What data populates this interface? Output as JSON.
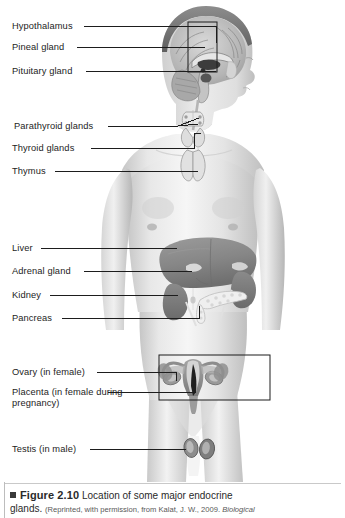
{
  "figure": {
    "number": "Figure 2.10",
    "marker": "square-bullet",
    "title": "Location of some major endocrine",
    "title_line2": "glands.",
    "credit": "(Reprinted, with permission, from Kalat, J. W., 2009. ",
    "credit_italic": "Biological"
  },
  "illustration": {
    "subject": "human male torso anterior view with endocrine glands",
    "colors": {
      "skin_light": "#f2f2f2",
      "skin_mid": "#d8d8d8",
      "skin_shadow": "#b9b9b9",
      "organ_liver": "#8e8e8e",
      "organ_kidney": "#7d7d7d",
      "organ_dark": "#5e5e5e",
      "organ_light": "#c9c9c9",
      "line": "#1d1d1d",
      "background": "#ffffff"
    },
    "callout_boxes": [
      {
        "name": "brain-detail-box",
        "x": 188,
        "y": 22,
        "w": 29,
        "h": 50
      },
      {
        "name": "uterus-detail-box",
        "x": 159,
        "y": 355,
        "w": 111,
        "h": 45
      }
    ]
  },
  "labels": [
    {
      "id": "hypothalamus",
      "text": "Hypothalamus",
      "x": 12,
      "y": 21,
      "line_x1": 84,
      "line_x2": 216,
      "line_y": 26
    },
    {
      "id": "pineal-gland",
      "text": "Pineal gland",
      "x": 12,
      "y": 42,
      "line_x1": 77,
      "line_x2": 212,
      "line_y": 47
    },
    {
      "id": "pituitary-gland",
      "text": "Pituitary gland",
      "x": 12,
      "y": 66,
      "line_x1": 86,
      "line_x2": 216,
      "line_y": 71
    },
    {
      "id": "parathyroid-glands",
      "text": "Parathyroid glands",
      "x": 14,
      "y": 121,
      "line_x1": 108,
      "line_x2": 196,
      "line_y": 126
    },
    {
      "id": "thyroid-glands",
      "text": "Thyroid glands",
      "x": 12,
      "y": 143,
      "line_x1": 91,
      "line_x2": 210,
      "line_y": 148
    },
    {
      "id": "thymus",
      "text": "Thymus",
      "x": 12,
      "y": 166,
      "line_x1": 55,
      "line_x2": 212,
      "line_y": 171
    },
    {
      "id": "liver",
      "text": "Liver",
      "x": 12,
      "y": 243,
      "line_x1": 41,
      "line_x2": 178,
      "line_y": 248
    },
    {
      "id": "adrenal-gland",
      "text": "Adrenal gland",
      "x": 12,
      "y": 266,
      "line_x1": 84,
      "line_x2": 196,
      "line_y": 271
    },
    {
      "id": "kidney",
      "text": "Kidney",
      "x": 12,
      "y": 290,
      "line_x1": 50,
      "line_x2": 183,
      "line_y": 295
    },
    {
      "id": "pancreas",
      "text": "Pancreas",
      "x": 12,
      "y": 313,
      "line_x1": 62,
      "line_x2": 205,
      "line_y": 318
    },
    {
      "id": "ovary-in-female",
      "text": "Ovary (in female)",
      "x": 12,
      "y": 367,
      "line_x1": 97,
      "line_x2": 184,
      "line_y": 372
    },
    {
      "id": "placenta-in-female",
      "text": "Placenta (in female during pregnancy)",
      "x": 12,
      "y": 387,
      "line_x1": 108,
      "line_x2": 212,
      "line_y": 392
    },
    {
      "id": "testis-in-male",
      "text": "Testis (in male)",
      "x": 12,
      "y": 444,
      "line_x1": 90,
      "line_x2": 196,
      "line_y": 449
    }
  ]
}
